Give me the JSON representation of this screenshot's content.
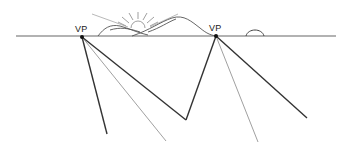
{
  "diagram": {
    "vanishing_points": [
      {
        "label": "VP",
        "x": 82,
        "y": 36
      },
      {
        "label": "VP",
        "x": 216,
        "y": 36
      }
    ],
    "horizon": {
      "y": 36,
      "x_start": 16,
      "x_end": 336
    },
    "elements": [
      "horizon-line",
      "sun",
      "mountains",
      "small-hill",
      "converging-lines"
    ],
    "colors": {
      "thick_line": "#333333",
      "thin_line": "#888888",
      "sketch": "#555555"
    }
  }
}
